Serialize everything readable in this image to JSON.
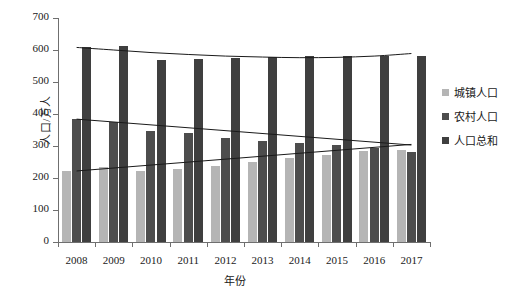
{
  "chart_data": {
    "type": "bar",
    "title": "",
    "xlabel": "年份",
    "ylabel": "人口/万人",
    "categories": [
      "2008",
      "2009",
      "2010",
      "2011",
      "2012",
      "2013",
      "2014",
      "2015",
      "2016",
      "2017"
    ],
    "ylim": [
      0,
      700
    ],
    "ytick_values": [
      0,
      100,
      200,
      300,
      400,
      500,
      600,
      700
    ],
    "ytick_labels": [
      "0",
      "100",
      "200",
      "300",
      "400",
      "500",
      "600",
      "700"
    ],
    "grid": false,
    "legend_position": "right",
    "series": [
      {
        "name": "城镇人口",
        "color": "#b5b5b5",
        "values": [
          223,
          233,
          221,
          227,
          237,
          250,
          262,
          272,
          283,
          288
        ]
      },
      {
        "name": "农村人口",
        "color": "#4d4d4d",
        "values": [
          383,
          375,
          347,
          341,
          324,
          317,
          310,
          303,
          294,
          280
        ]
      },
      {
        "name": "人口总和",
        "color": "#3f3f3f",
        "values": [
          609,
          614,
          569,
          572,
          576,
          578,
          580,
          581,
          582,
          582
        ]
      }
    ],
    "trendlines": [
      {
        "name": "人口总和趋势线",
        "for_series": "人口总和",
        "shape": "curve",
        "points": [
          [
            2008,
            608
          ],
          [
            2009,
            600
          ],
          [
            2010,
            592
          ],
          [
            2011,
            586
          ],
          [
            2012,
            581
          ],
          [
            2013,
            578
          ],
          [
            2014,
            576
          ],
          [
            2015,
            577
          ],
          [
            2016,
            581
          ],
          [
            2017,
            589
          ]
        ]
      },
      {
        "name": "农村人口趋势线",
        "for_series": "农村人口",
        "shape": "line",
        "points": [
          [
            2008,
            384
          ],
          [
            2017,
            303
          ]
        ]
      },
      {
        "name": "城镇人口趋势线",
        "for_series": "城镇人口",
        "shape": "line",
        "points": [
          [
            2008,
            222
          ],
          [
            2017,
            305
          ]
        ]
      }
    ]
  },
  "legend": {
    "items": [
      {
        "label": "城镇人口",
        "color": "#b5b5b5"
      },
      {
        "label": "农村人口",
        "color": "#4d4d4d"
      },
      {
        "label": "人口总和",
        "color": "#3f3f3f"
      }
    ]
  }
}
